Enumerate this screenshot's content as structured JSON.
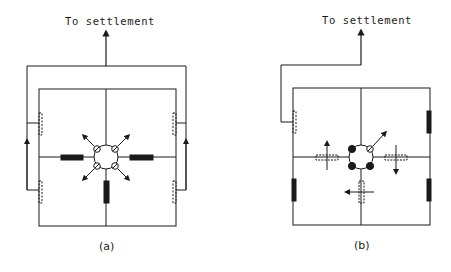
{
  "diagrams": [
    {
      "id": "a",
      "caption": "(a)",
      "outlet_label": "To settlement",
      "description": "Quadrant layout with central junction of four open valves; open pipes (solid) radiating from center; dashed inlets on outer walls feed up to collector leading to settlement"
    },
    {
      "id": "b",
      "caption": "(b)",
      "outlet_label": "To settlement",
      "description": "Quadrant layout with central junction, three closed valves (filled) and one open; dashed closed pipes with flow arrows; solid wall inlets on right side; single dashed inlet upper-left feeds to settlement"
    }
  ],
  "colors": {
    "line": "#1a1a1a",
    "background": "#ffffff"
  }
}
